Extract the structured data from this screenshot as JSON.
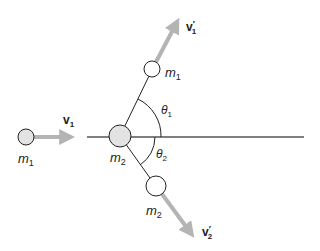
{
  "diagram": {
    "colors": {
      "line": "#222222",
      "ball_fill": "#e3e3e3",
      "ball_fill_after": "#ffffff",
      "arrow": "#b4b4b4",
      "background": "#ffffff"
    },
    "before": {
      "ball_1": {
        "label": "m",
        "sub": "1",
        "cx": 26,
        "cy": 137,
        "r": 8
      },
      "ball_2": {
        "label": "m",
        "sub": "2",
        "cx": 120,
        "cy": 136,
        "r": 11
      },
      "velocity_1": {
        "label": "v",
        "sub": "1"
      }
    },
    "after": {
      "ball_1": {
        "label": "m",
        "sub": "1",
        "cx": 152,
        "cy": 69,
        "r": 8
      },
      "ball_2": {
        "label": "m",
        "sub": "2",
        "cx": 156,
        "cy": 186,
        "r": 10
      },
      "velocity_1": {
        "label": "v",
        "prime": "′",
        "sub": "1"
      },
      "velocity_2": {
        "label": "v",
        "prime": "′",
        "sub": "2"
      }
    },
    "angles": {
      "theta_1": {
        "label": "θ",
        "sub": "1"
      },
      "theta_2": {
        "label": "θ",
        "sub": "2"
      }
    }
  }
}
